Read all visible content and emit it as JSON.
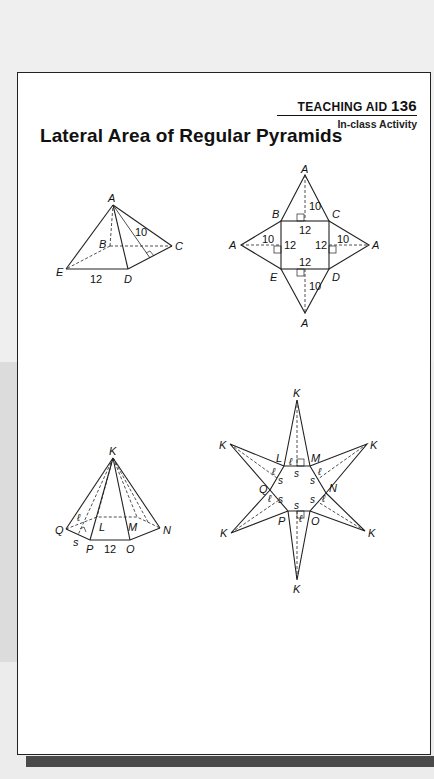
{
  "header": {
    "label_prefix": "TEACHING AID",
    "number": "136",
    "subtitle": "In-class Activity"
  },
  "page_title": "Lateral Area of Regular Pyramids",
  "figures": {
    "square_pyramid": {
      "vertices": [
        "A",
        "B",
        "C",
        "D",
        "E"
      ],
      "base_edge": "12",
      "slant_height": "10"
    },
    "square_net": {
      "apex_labels": [
        "A",
        "A",
        "A",
        "A"
      ],
      "base_labels": [
        "B",
        "C",
        "D",
        "E"
      ],
      "edge_labels": [
        "12",
        "12",
        "12",
        "12"
      ],
      "slant_labels": [
        "10",
        "10",
        "10",
        "10"
      ]
    },
    "hexagonal_pyramid": {
      "vertices": [
        "K",
        "L",
        "M",
        "N",
        "O",
        "P",
        "Q"
      ],
      "base_edge": "12",
      "side_label": "s",
      "slant_label": "ℓ"
    },
    "hexagonal_net": {
      "apex_labels": [
        "K",
        "K",
        "K",
        "K",
        "K",
        "K"
      ],
      "base_labels": [
        "L",
        "M",
        "N",
        "O",
        "P",
        "Q"
      ],
      "side_label": "s",
      "slant_label": "ℓ"
    }
  }
}
